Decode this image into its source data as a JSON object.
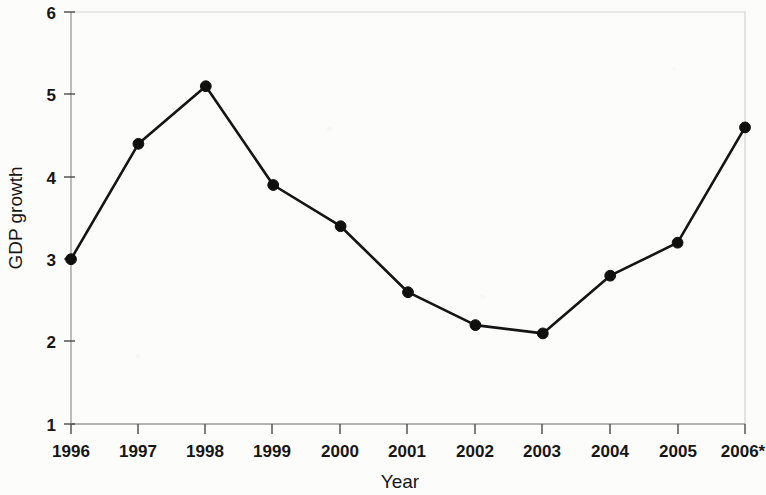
{
  "figure": {
    "background_color": "#fcfcfa",
    "line_color": "#141414",
    "marker_color": "#101010",
    "frame_color": "#d3d3d3"
  },
  "axes": {
    "y_title": "GDP growth",
    "x_title": "Year",
    "y_ticks": [
      "6",
      "5",
      "4",
      "3",
      "2",
      "1"
    ],
    "x_ticks": [
      "1996",
      "1997",
      "1998",
      "1999",
      "2000",
      "2001",
      "2002",
      "2003",
      "2004",
      "2005",
      "2006*"
    ]
  },
  "chart_data": {
    "type": "line",
    "title": "",
    "xlabel": "Year",
    "ylabel": "GDP growth",
    "categories": [
      "1996",
      "1997",
      "1998",
      "1999",
      "2000",
      "2001",
      "2002",
      "2003",
      "2004",
      "2005",
      "2006*"
    ],
    "values": [
      3.0,
      4.4,
      5.1,
      3.9,
      3.4,
      2.6,
      2.2,
      2.1,
      2.8,
      3.2,
      4.6
    ],
    "ylim": [
      1,
      6
    ],
    "ytick_values": [
      1,
      2,
      3,
      4,
      5,
      6
    ],
    "grid": false,
    "legend": null,
    "marker": "filled-circle",
    "note": "2006 value marked with asterisk (projection)"
  }
}
